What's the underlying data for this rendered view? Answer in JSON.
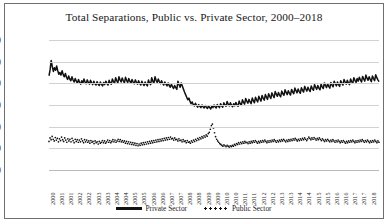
{
  "chart_data": {
    "type": "line",
    "title": "Total Separations, Public vs. Private Sector, 2000–2018",
    "xlabel": "",
    "ylabel": "Quitting Rate (%)",
    "ylim": [
      0.0,
      6.0
    ],
    "yticks": [
      "0.0",
      "1.0",
      "2.0",
      "3.0",
      "4.0",
      "5.0",
      "6.0"
    ],
    "grid": true,
    "legend_position": "bottom",
    "xtick_labels": [
      "2000",
      "2001",
      "2001",
      "2002",
      "2002",
      "2003",
      "2003",
      "2004",
      "2004",
      "2005",
      "2005",
      "2006",
      "2006",
      "2007",
      "2007",
      "2008",
      "2008",
      "2009",
      "2009",
      "2010",
      "2010",
      "2011",
      "2011",
      "2012",
      "2012",
      "2013",
      "2013",
      "2014",
      "2014",
      "2015",
      "2015",
      "2016",
      "2016",
      "2017",
      "2017",
      "2018"
    ],
    "x_start": 2000.0,
    "x_end": 2018.75,
    "series": [
      {
        "name": "Private Sector",
        "style": "solid",
        "color": "#111111",
        "values": [
          4.35,
          4.62,
          5.05,
          4.78,
          4.55,
          4.72,
          4.6,
          4.8,
          4.58,
          4.42,
          4.5,
          4.38,
          4.58,
          4.4,
          4.3,
          4.45,
          4.28,
          4.18,
          4.34,
          4.2,
          4.12,
          4.3,
          4.16,
          4.06,
          4.22,
          4.1,
          4.0,
          4.18,
          4.05,
          3.96,
          4.12,
          4.0,
          4.2,
          4.06,
          3.98,
          4.16,
          4.04,
          3.96,
          4.14,
          4.02,
          3.94,
          4.1,
          3.98,
          3.92,
          4.08,
          3.96,
          3.9,
          4.06,
          3.95,
          3.88,
          4.04,
          3.94,
          4.1,
          4.0,
          3.92,
          4.14,
          4.02,
          3.96,
          4.2,
          4.08,
          4.0,
          4.26,
          4.12,
          4.02,
          4.3,
          4.16,
          4.06,
          4.25,
          4.12,
          4.02,
          4.28,
          4.14,
          4.04,
          4.22,
          4.1,
          4.0,
          4.18,
          4.06,
          3.98,
          4.16,
          4.05,
          3.96,
          4.12,
          4.0,
          3.92,
          4.1,
          3.98,
          3.9,
          4.06,
          3.95,
          3.88,
          4.15,
          4.02,
          3.94,
          4.26,
          4.1,
          4.0,
          4.3,
          4.14,
          4.04,
          4.2,
          4.08,
          3.98,
          4.12,
          4.0,
          3.92,
          4.06,
          3.96,
          3.88,
          4.02,
          3.9,
          3.82,
          3.96,
          3.85,
          3.76,
          3.9,
          3.8,
          3.72,
          4.1,
          3.95,
          3.82,
          4.02,
          3.88,
          3.74,
          3.6,
          3.48,
          3.36,
          3.24,
          3.32,
          3.18,
          3.06,
          3.14,
          3.02,
          2.96,
          3.08,
          2.98,
          2.9,
          3.02,
          2.94,
          2.88,
          3.0,
          2.92,
          2.86,
          2.98,
          2.9,
          2.84,
          2.96,
          2.88,
          2.82,
          2.94,
          2.88,
          3.0,
          2.92,
          2.86,
          3.02,
          2.94,
          2.88,
          3.06,
          2.96,
          2.9,
          3.1,
          3.0,
          2.94,
          3.16,
          3.04,
          2.96,
          3.1,
          3.0,
          2.92,
          3.06,
          2.96,
          3.12,
          3.02,
          2.94,
          3.18,
          3.06,
          2.98,
          3.24,
          3.12,
          3.04,
          3.3,
          3.18,
          3.08,
          3.26,
          3.14,
          3.06,
          3.32,
          3.2,
          3.1,
          3.36,
          3.24,
          3.14,
          3.4,
          3.28,
          3.18,
          3.44,
          3.32,
          3.22,
          3.48,
          3.36,
          3.26,
          3.52,
          3.4,
          3.3,
          3.56,
          3.44,
          3.34,
          3.62,
          3.5,
          3.4,
          3.58,
          3.46,
          3.38,
          3.64,
          3.52,
          3.44,
          3.7,
          3.58,
          3.48,
          3.66,
          3.54,
          3.46,
          3.72,
          3.6,
          3.52,
          3.78,
          3.66,
          3.56,
          3.74,
          3.62,
          3.54,
          3.8,
          3.68,
          3.6,
          3.86,
          3.74,
          3.64,
          3.82,
          3.7,
          3.62,
          3.88,
          3.76,
          3.68,
          3.94,
          3.82,
          3.72,
          3.9,
          3.78,
          3.7,
          3.96,
          3.84,
          3.76,
          4.02,
          3.9,
          3.8,
          3.98,
          3.86,
          3.78,
          4.04,
          3.92,
          3.84,
          4.1,
          3.98,
          3.88,
          4.06,
          3.94,
          3.86,
          4.12,
          4.0,
          3.92,
          4.18,
          4.06,
          3.96,
          4.14,
          4.02,
          3.94,
          4.2,
          4.08,
          4.0,
          4.26,
          4.14,
          4.04,
          4.22,
          4.1,
          4.28,
          4.16,
          4.06,
          4.32,
          4.2,
          4.1,
          4.38,
          4.24,
          4.14,
          4.3,
          4.18,
          4.08,
          4.34,
          4.22,
          4.12,
          4.4,
          4.26,
          4.16,
          4.08
        ]
      },
      {
        "name": "Public Sector",
        "style": "dotted",
        "color": "#111111",
        "values": [
          1.32,
          1.48,
          1.4,
          1.55,
          1.42,
          1.34,
          1.5,
          1.38,
          1.46,
          1.3,
          1.44,
          1.36,
          1.52,
          1.4,
          1.32,
          1.48,
          1.38,
          1.28,
          1.44,
          1.34,
          1.42,
          1.3,
          1.46,
          1.36,
          1.26,
          1.42,
          1.32,
          1.4,
          1.28,
          1.38,
          1.3,
          1.44,
          1.34,
          1.26,
          1.4,
          1.3,
          1.38,
          1.28,
          1.34,
          1.24,
          1.36,
          1.28,
          1.32,
          1.22,
          1.34,
          1.26,
          1.3,
          1.2,
          1.32,
          1.24,
          1.28,
          1.36,
          1.26,
          1.34,
          1.24,
          1.3,
          1.38,
          1.28,
          1.36,
          1.26,
          1.32,
          1.4,
          1.3,
          1.38,
          1.28,
          1.34,
          1.42,
          1.32,
          1.4,
          1.3,
          1.36,
          1.28,
          1.34,
          1.24,
          1.32,
          1.22,
          1.3,
          1.2,
          1.28,
          1.18,
          1.26,
          1.16,
          1.24,
          1.14,
          1.22,
          1.12,
          1.2,
          1.14,
          1.24,
          1.16,
          1.26,
          1.18,
          1.28,
          1.2,
          1.3,
          1.22,
          1.32,
          1.24,
          1.34,
          1.26,
          1.36,
          1.28,
          1.38,
          1.3,
          1.4,
          1.32,
          1.42,
          1.34,
          1.44,
          1.36,
          1.46,
          1.38,
          1.48,
          1.4,
          1.5,
          1.42,
          1.52,
          1.44,
          1.46,
          1.38,
          1.48,
          1.4,
          1.42,
          1.34,
          1.44,
          1.36,
          1.38,
          1.3,
          1.4,
          1.32,
          1.34,
          1.26,
          1.36,
          1.28,
          1.3,
          1.24,
          1.34,
          1.28,
          1.38,
          1.32,
          1.42,
          1.36,
          1.46,
          1.4,
          1.5,
          1.44,
          1.54,
          1.48,
          1.58,
          1.52,
          1.62,
          1.56,
          1.68,
          1.74,
          1.88,
          2.05,
          2.12,
          1.94,
          1.72,
          1.54,
          1.42,
          1.34,
          1.28,
          1.22,
          1.18,
          1.14,
          1.1,
          1.16,
          1.12,
          1.08,
          1.14,
          1.1,
          1.06,
          1.12,
          1.08,
          1.14,
          1.1,
          1.18,
          1.14,
          1.22,
          1.18,
          1.26,
          1.2,
          1.28,
          1.22,
          1.3,
          1.24,
          1.32,
          1.26,
          1.28,
          1.22,
          1.3,
          1.24,
          1.32,
          1.26,
          1.34,
          1.28,
          1.36,
          1.3,
          1.24,
          1.32,
          1.26,
          1.34,
          1.28,
          1.36,
          1.3,
          1.38,
          1.32,
          1.26,
          1.34,
          1.28,
          1.36,
          1.3,
          1.38,
          1.32,
          1.4,
          1.34,
          1.28,
          1.36,
          1.3,
          1.38,
          1.32,
          1.4,
          1.34,
          1.42,
          1.36,
          1.3,
          1.38,
          1.32,
          1.4,
          1.34,
          1.42,
          1.36,
          1.44,
          1.38,
          1.46,
          1.4,
          1.34,
          1.42,
          1.36,
          1.44,
          1.38,
          1.46,
          1.4,
          1.48,
          1.42,
          1.36,
          1.44,
          1.52,
          1.46,
          1.4,
          1.48,
          1.42,
          1.5,
          1.44,
          1.38,
          1.46,
          1.4,
          1.48,
          1.42,
          1.36,
          1.44,
          1.38,
          1.32,
          1.4,
          1.34,
          1.42,
          1.36,
          1.3,
          1.38,
          1.32,
          1.4,
          1.34,
          1.28,
          1.36,
          1.3,
          1.38,
          1.32,
          1.26,
          1.34,
          1.28,
          1.36,
          1.3,
          1.24,
          1.32,
          1.26,
          1.34,
          1.28,
          1.36,
          1.3,
          1.38,
          1.32,
          1.26,
          1.34,
          1.28,
          1.36,
          1.3,
          1.38,
          1.32,
          1.4,
          1.34,
          1.28,
          1.36,
          1.3,
          1.38,
          1.32,
          1.26,
          1.34,
          1.28,
          1.36,
          1.3,
          1.38,
          1.32,
          1.26,
          1.34,
          1.28
        ]
      }
    ]
  }
}
